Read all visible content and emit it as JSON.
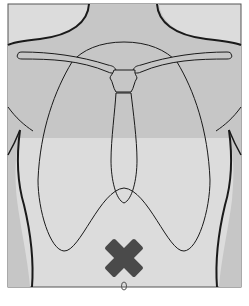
{
  "diagram": {
    "type": "anatomical-torso-front",
    "marker": {
      "shape": "cross",
      "icon": "x-mark-icon",
      "color": "#4a4a4a",
      "location": "upper abdomen, below sternum / above navel"
    },
    "navel_label": "0",
    "colors": {
      "background": "#dcdcdc",
      "body_fill": "#c6c6c6",
      "outline": "#1a1a1a",
      "frame": "#555555"
    }
  }
}
